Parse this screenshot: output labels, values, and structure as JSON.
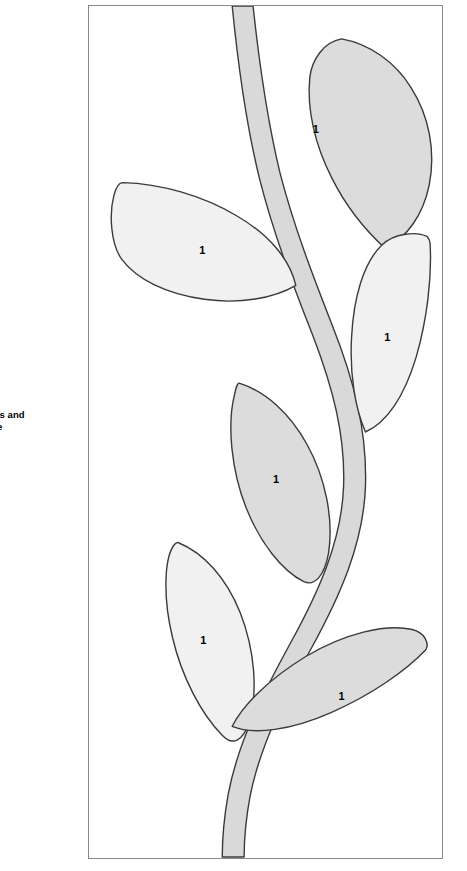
{
  "caption": {
    "line1": "Patterns and",
    "line2": "Guide",
    "clipped": true
  },
  "panel": {
    "name": "applique-pattern-panel",
    "border_color": "#888888",
    "background": "#ffffff"
  },
  "colors": {
    "outline": "#3a3a3a",
    "stem_fill": "#d9d9d9",
    "leaf_fill_dark": "#dcdcdc",
    "leaf_fill_light": "#f1f1f1",
    "label_text": "#000000",
    "page_background": "#ffffff"
  },
  "illustration": {
    "type": "applique-vine-pattern",
    "stem": {
      "label": "vine-stem",
      "fill": "#d9d9d9"
    },
    "leaves": [
      {
        "id": "leaf-top-right",
        "number": "1",
        "fill": "#dcdcdc",
        "label_x": 316,
        "label_y": 129
      },
      {
        "id": "leaf-upper-left",
        "number": "1",
        "fill": "#f1f1f1",
        "label_x": 202,
        "label_y": 251
      },
      {
        "id": "leaf-middle-right",
        "number": "1",
        "fill": "#f1f1f1",
        "label_x": 388,
        "label_y": 338
      },
      {
        "id": "leaf-middle-left",
        "number": "1",
        "fill": "#dcdcdc",
        "label_x": 276,
        "label_y": 480
      },
      {
        "id": "leaf-lower-left",
        "number": "1",
        "fill": "#f1f1f1",
        "label_x": 203,
        "label_y": 642
      },
      {
        "id": "leaf-bottom-right",
        "number": "1",
        "fill": "#dcdcdc",
        "label_x": 342,
        "label_y": 698
      }
    ]
  }
}
